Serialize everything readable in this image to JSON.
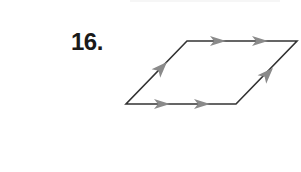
{
  "problem": {
    "number": "16."
  },
  "figure": {
    "shape": "parallelogram",
    "vertices": {
      "bottom_left": [
        126,
        104
      ],
      "bottom_right": [
        236,
        104
      ],
      "top_right": [
        297,
        41
      ],
      "top_left": [
        187,
        41
      ]
    },
    "markings": {
      "horizontal_sides": "double arrows (parallel)",
      "slanted_sides": "single arrow (parallel)"
    },
    "colors": {
      "stroke": "#333333",
      "arrow": "#8a8a8a"
    }
  }
}
